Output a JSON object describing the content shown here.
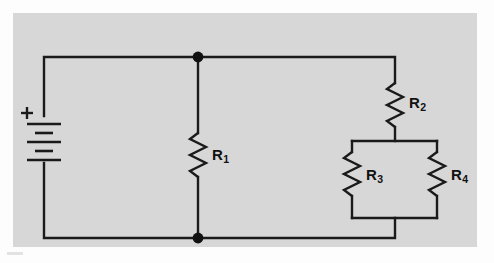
{
  "figure": {
    "kind": "electrical-schematic",
    "panel_color": "#d7d7d7",
    "page_color": "#fdfdfd",
    "wire_color": "#1a1a1a"
  },
  "source": {
    "type": "battery",
    "polarity_label": "+",
    "cells": 2,
    "plate_count": 4
  },
  "components": [
    {
      "id": "R1",
      "label": "R",
      "subscript": "1",
      "type": "resistor",
      "orientation": "vertical",
      "branch": "shunt-center"
    },
    {
      "id": "R2",
      "label": "R",
      "subscript": "2",
      "type": "resistor",
      "orientation": "vertical",
      "branch": "series-right"
    },
    {
      "id": "R3",
      "label": "R",
      "subscript": "3",
      "type": "resistor",
      "orientation": "vertical",
      "branch": "parallel-left"
    },
    {
      "id": "R4",
      "label": "R",
      "subscript": "4",
      "type": "resistor",
      "orientation": "vertical",
      "branch": "parallel-right"
    }
  ],
  "nodes": [
    {
      "id": "top-junction",
      "x": 198,
      "y": 57
    },
    {
      "id": "bottom-junction",
      "x": 198,
      "y": 238
    }
  ],
  "labels": {
    "r1": "R",
    "r1_sub": "1",
    "r2": "R",
    "r2_sub": "2",
    "r3": "R",
    "r3_sub": "3",
    "r4": "R",
    "r4_sub": "4",
    "plus": "+"
  }
}
